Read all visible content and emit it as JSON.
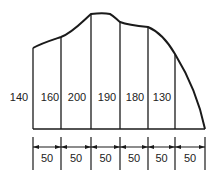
{
  "diagram": {
    "colors": {
      "stroke": "#1a1a1a",
      "text": "#222222",
      "background": "#ffffff"
    },
    "ordinates": [
      {
        "label": "140",
        "x": 33,
        "top": 48
      },
      {
        "label": "160",
        "x": 61,
        "top": 37
      },
      {
        "label": "200",
        "x": 91,
        "top": 14
      },
      {
        "label": "190",
        "x": 120,
        "top": 22
      },
      {
        "label": "180",
        "x": 148,
        "top": 27
      },
      {
        "label": "130",
        "x": 175,
        "top": 54
      }
    ],
    "end_point": {
      "x": 205,
      "y": 129
    },
    "baseline_y": 129,
    "intervals": [
      {
        "label": "50"
      },
      {
        "label": "50"
      },
      {
        "label": "50"
      },
      {
        "label": "50"
      },
      {
        "label": "50"
      },
      {
        "label": "50"
      }
    ]
  }
}
